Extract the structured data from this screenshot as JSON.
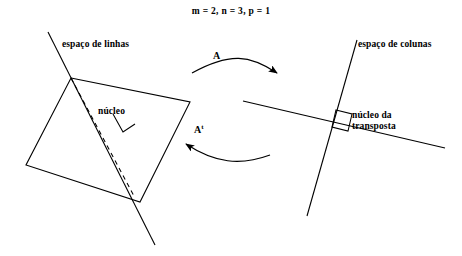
{
  "title": "m = 2, n = 3, p = 1",
  "labels": {
    "row_space": "espaço de linhas",
    "column_space": "espaço de colunas",
    "kernel": "núcleo",
    "kernel_transpose_line1": "núcleo da",
    "kernel_transpose_line2": "transposta",
    "map_forward": "A",
    "map_transpose_base": "A",
    "map_transpose_sup": "t"
  },
  "colors": {
    "stroke": "#000000",
    "background": "#ffffff",
    "text": "#000000"
  },
  "geometry": {
    "row_space_plane": [
      [
        71,
        78
      ],
      [
        190,
        102
      ],
      [
        140,
        202
      ],
      [
        26,
        165
      ]
    ],
    "row_space_line": [
      [
        48,
        32
      ],
      [
        155,
        245
      ]
    ],
    "kernel_dashed_line": [
      [
        71,
        78
      ],
      [
        134,
        196
      ]
    ],
    "kernel_right_angle": [
      [
        113,
        114
      ],
      [
        123,
        132
      ],
      [
        135,
        124
      ]
    ],
    "column_space_line": [
      [
        243,
        101
      ],
      [
        445,
        148
      ]
    ],
    "kernel_transpose_line": [
      [
        357,
        40
      ],
      [
        307,
        216
      ]
    ],
    "kernel_transpose_right_angle": [
      [
        336,
        110
      ],
      [
        352,
        114
      ],
      [
        348,
        131
      ],
      [
        332,
        127
      ]
    ],
    "arrow_forward": {
      "start": [
        192,
        73
      ],
      "c1": [
        230,
        52
      ],
      "c2": [
        250,
        55
      ],
      "end": [
        277,
        73
      ]
    },
    "arrow_transpose": {
      "start": [
        270,
        155
      ],
      "c1": [
        240,
        166
      ],
      "c2": [
        215,
        163
      ],
      "end": [
        186,
        144
      ]
    }
  }
}
